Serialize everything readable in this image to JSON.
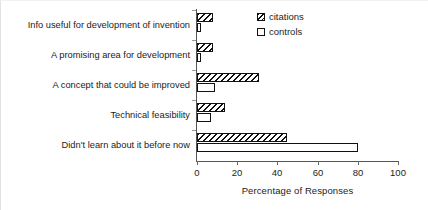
{
  "chart_data": {
    "type": "bar",
    "orientation": "horizontal",
    "title": "",
    "xlabel": "Percentage of Responses",
    "ylabel": "",
    "xlim": [
      0,
      100
    ],
    "xticks": [
      0,
      20,
      40,
      60,
      80,
      100
    ],
    "grid": false,
    "legend_position": "top-right",
    "categories": [
      "Info useful for development of invention",
      "A promising area for development",
      "A concept that could be improved",
      "Technical feasibility",
      "Didn't learn about it before now"
    ],
    "series": [
      {
        "name": "citations",
        "values": [
          8,
          8,
          31,
          14,
          45
        ]
      },
      {
        "name": "controls",
        "values": [
          2,
          2,
          9,
          7,
          80
        ]
      }
    ]
  },
  "legend": {
    "items": [
      {
        "label": "citations",
        "swatch": "hatched-square"
      },
      {
        "label": "controls",
        "swatch": "open-square"
      }
    ]
  },
  "axis": {
    "x_title": "Percentage of Responses",
    "x_tick_labels": [
      "0",
      "20",
      "40",
      "60",
      "80",
      "100"
    ]
  },
  "colors": {
    "bar_outline": "#111111",
    "bar_fill": "#ffffff",
    "axis": "#555555",
    "text": "#1c1c1c",
    "background": "#ffffff"
  }
}
